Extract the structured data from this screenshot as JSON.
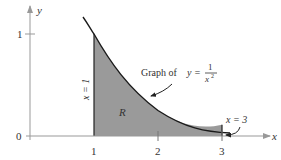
{
  "diagram": {
    "axes": {
      "x_label": "x",
      "y_label": "y",
      "x_ticks": [
        "1",
        "2",
        "3"
      ],
      "y_ticks": [
        "0",
        "1"
      ]
    },
    "annotations": {
      "graph_prefix": "Graph of",
      "graph_eq_lhs": "y =",
      "graph_eq_num": "1",
      "graph_eq_den": "x",
      "graph_eq_exp": "2",
      "left_bound": "x = 1",
      "right_bound": "x = 3",
      "region_label": "R"
    },
    "colors": {
      "region_fill": "#9a9a9a",
      "curve": "#1a1a1a",
      "axis": "#888888"
    }
  }
}
